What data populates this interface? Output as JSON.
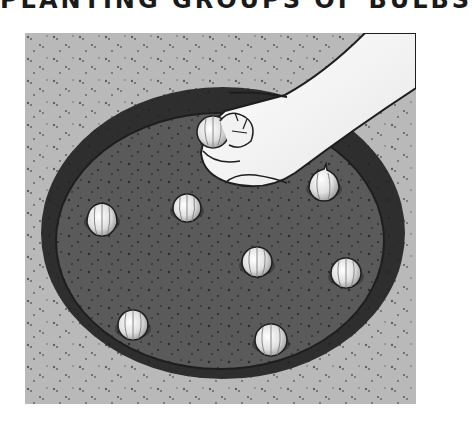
{
  "title": "PLANTING GROUPS OF BULBS",
  "illustration": {
    "subject": "hand placing bulbs in a round planting hole",
    "colors": {
      "ground": "#b9b9b9",
      "hole_fill": "#5a5a5a",
      "hole_wall": "#2e2e2e",
      "bulb": "#e6e6e6",
      "skin": "#f2f2f2",
      "outline": "#1e1e1e"
    },
    "bulbs": [
      {
        "x": 77,
        "y": 187,
        "r": 15
      },
      {
        "x": 162,
        "y": 175,
        "r": 14
      },
      {
        "x": 299,
        "y": 152,
        "r": 15
      },
      {
        "x": 232,
        "y": 229,
        "r": 15
      },
      {
        "x": 321,
        "y": 240,
        "r": 15
      },
      {
        "x": 108,
        "y": 292,
        "r": 15
      },
      {
        "x": 246,
        "y": 307,
        "r": 16
      }
    ],
    "held_bulb": {
      "x": 188,
      "y": 97,
      "r": 16
    }
  }
}
